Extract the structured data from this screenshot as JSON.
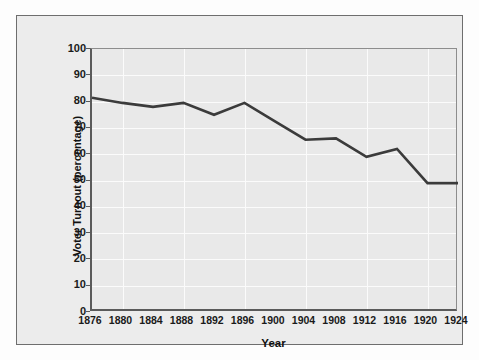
{
  "chart_data": {
    "type": "line",
    "title": "",
    "xlabel": "Year",
    "ylabel": "Voter Turnout (percentage)",
    "x": [
      1876,
      1880,
      1884,
      1888,
      1892,
      1896,
      1900,
      1904,
      1908,
      1912,
      1916,
      1920,
      1924
    ],
    "values": [
      81.5,
      79.5,
      78.0,
      79.5,
      75.0,
      79.5,
      72.5,
      65.5,
      66.0,
      59.0,
      62.0,
      49.0,
      49.0
    ],
    "series": [
      {
        "name": "Voter Turnout",
        "values": [
          81.5,
          79.5,
          78.0,
          79.5,
          75.0,
          79.5,
          72.5,
          65.5,
          66.0,
          59.0,
          62.0,
          49.0,
          49.0
        ]
      }
    ],
    "xtick_labels": [
      "1876",
      "1880",
      "1884",
      "1888",
      "1892",
      "1896",
      "1900",
      "1904",
      "1908",
      "1912",
      "1916",
      "1920",
      "1924"
    ],
    "ytick_labels": [
      "100",
      "90",
      "80",
      "70",
      "60",
      "50",
      "40",
      "30",
      "20",
      "10",
      "0"
    ],
    "ytick_values": [
      100,
      90,
      80,
      70,
      60,
      50,
      40,
      30,
      20,
      10,
      0
    ],
    "xlim": [
      1876,
      1924
    ],
    "ylim": [
      0,
      100
    ],
    "grid": true,
    "legend": "none",
    "line_color": "#3b3b3b",
    "grid_color": "#fbfbfb",
    "plot_background": "#e9e9e9",
    "figure_background": "#ececec",
    "axis_color": "#5a5a5a"
  }
}
